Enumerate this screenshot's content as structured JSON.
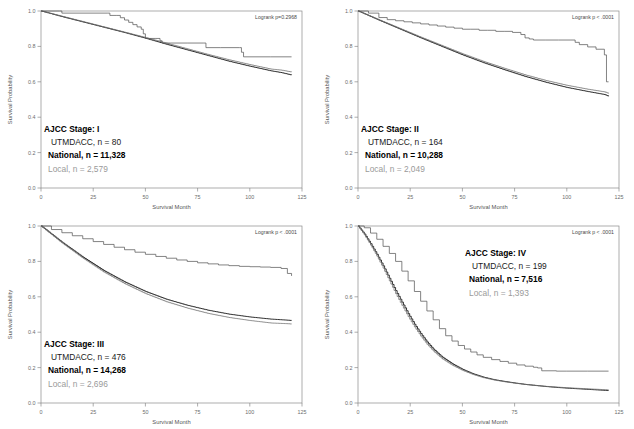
{
  "figure": {
    "axis": {
      "xlabel": "Survival Month",
      "ylabel": "Survival Probability",
      "xticks": [
        "0",
        "25",
        "50",
        "75",
        "100",
        "125"
      ],
      "yticks": [
        "1.0",
        "0.8",
        "0.6",
        "0.4",
        "0.2",
        "0.0"
      ],
      "xlim": [
        0,
        125
      ],
      "ylim": [
        0.0,
        1.0
      ]
    },
    "series_names": {
      "utmdacc": "UTMDACC",
      "national": "National",
      "local": "Local"
    },
    "colors": {
      "utmdacc": "#5a5a5a",
      "national": "#1c1c1c",
      "local": "#9a9a9a",
      "frame": "#8a8a8a",
      "background": "#ffffff"
    }
  },
  "chart_data": [
    {
      "type": "line",
      "title": "AJCC Stage: I",
      "panel_index": 0,
      "stage_label": "AJCC Stage: I",
      "utmdacc_label": "UTMDACC,  n = 80",
      "national_label": "National, n = 11,328",
      "local_label": "Local, n =  2,579",
      "pvalue_label": "Logrank p=0.2968",
      "counts": {
        "utmdacc": 80,
        "national": 11328,
        "local": 2579
      },
      "xlabel": "Survival Month",
      "ylabel": "Survival Probability",
      "xlim": [
        0,
        125
      ],
      "ylim": [
        0.0,
        1.0
      ],
      "grid": false,
      "legend_position": "inside-lower-left",
      "series": [
        {
          "name": "UTMDACC",
          "x": [
            0,
            2,
            9,
            10,
            32,
            33,
            36,
            38,
            40,
            42,
            44,
            46,
            48,
            49,
            50,
            51,
            55,
            57,
            58,
            62,
            70,
            78,
            79,
            86,
            95,
            96,
            97,
            110,
            120
          ],
          "values": [
            1.0,
            1.0,
            1.0,
            0.988,
            0.988,
            0.975,
            0.975,
            0.962,
            0.949,
            0.936,
            0.923,
            0.91,
            0.897,
            0.871,
            0.845,
            0.845,
            0.845,
            0.832,
            0.819,
            0.819,
            0.819,
            0.819,
            0.793,
            0.793,
            0.793,
            0.767,
            0.741,
            0.741,
            0.741
          ]
        },
        {
          "name": "National",
          "x": [
            0,
            10,
            20,
            30,
            40,
            50,
            60,
            70,
            80,
            90,
            100,
            110,
            115,
            120
          ],
          "values": [
            1.0,
            0.968,
            0.938,
            0.908,
            0.878,
            0.846,
            0.812,
            0.78,
            0.748,
            0.716,
            0.688,
            0.662,
            0.652,
            0.638
          ]
        },
        {
          "name": "Local",
          "x": [
            0,
            10,
            20,
            30,
            40,
            50,
            60,
            70,
            80,
            90,
            100,
            110,
            115,
            120
          ],
          "values": [
            1.0,
            0.97,
            0.94,
            0.91,
            0.88,
            0.85,
            0.818,
            0.786,
            0.754,
            0.724,
            0.697,
            0.672,
            0.666,
            0.655
          ]
        }
      ]
    },
    {
      "type": "line",
      "title": "AJCC Stage: II",
      "panel_index": 1,
      "stage_label": "AJCC Stage: II",
      "utmdacc_label": "UTMDACC,  n = 164",
      "national_label": "National, n = 10,288",
      "local_label": "Local, n = 2,049",
      "pvalue_label": "Logrank p < .0001",
      "counts": {
        "utmdacc": 164,
        "national": 10288,
        "local": 2049
      },
      "xlabel": "Survival Month",
      "ylabel": "Survival Probability",
      "xlim": [
        0,
        125
      ],
      "ylim": [
        0.0,
        1.0
      ],
      "grid": false,
      "legend_position": "inside-lower-left",
      "series": [
        {
          "name": "UTMDACC",
          "x": [
            0,
            5,
            10,
            14,
            18,
            22,
            26,
            30,
            34,
            38,
            42,
            46,
            50,
            54,
            58,
            62,
            66,
            70,
            74,
            78,
            80,
            82,
            84,
            90,
            96,
            102,
            104,
            106,
            110,
            114,
            118,
            119,
            120
          ],
          "values": [
            1.0,
            0.988,
            0.963,
            0.951,
            0.945,
            0.939,
            0.933,
            0.927,
            0.921,
            0.915,
            0.909,
            0.903,
            0.897,
            0.897,
            0.891,
            0.891,
            0.885,
            0.885,
            0.879,
            0.867,
            0.848,
            0.842,
            0.836,
            0.836,
            0.836,
            0.836,
            0.823,
            0.81,
            0.797,
            0.784,
            0.752,
            0.6,
            0.6
          ]
        },
        {
          "name": "National",
          "x": [
            0,
            10,
            20,
            30,
            40,
            50,
            60,
            70,
            80,
            90,
            100,
            110,
            118,
            120
          ],
          "values": [
            1.0,
            0.948,
            0.898,
            0.848,
            0.8,
            0.752,
            0.708,
            0.668,
            0.63,
            0.597,
            0.568,
            0.545,
            0.528,
            0.518
          ]
        },
        {
          "name": "Local",
          "x": [
            0,
            10,
            20,
            30,
            40,
            50,
            60,
            70,
            80,
            90,
            100,
            110,
            118,
            120
          ],
          "values": [
            1.0,
            0.95,
            0.901,
            0.852,
            0.805,
            0.758,
            0.715,
            0.676,
            0.639,
            0.607,
            0.58,
            0.558,
            0.543,
            0.534
          ]
        }
      ]
    },
    {
      "type": "line",
      "title": "AJCC Stage: III",
      "panel_index": 2,
      "stage_label": "AJCC Stage: III",
      "utmdacc_label": "UTMDACC,  n = 476",
      "national_label": "National, n = 14,268",
      "local_label": "Local, n =  2,696",
      "pvalue_label": "Logrank p < .0001",
      "counts": {
        "utmdacc": 476,
        "national": 14268,
        "local": 2696
      },
      "xlabel": "Survival Month",
      "ylabel": "Survival Probability",
      "xlim": [
        0,
        125
      ],
      "ylim": [
        0.0,
        1.0
      ],
      "grid": false,
      "legend_position": "inside-lower-left",
      "series": [
        {
          "name": "UTMDACC",
          "x": [
            0,
            5,
            10,
            15,
            20,
            25,
            30,
            35,
            40,
            45,
            50,
            55,
            60,
            65,
            70,
            75,
            80,
            85,
            90,
            95,
            100,
            105,
            110,
            115,
            118,
            120
          ],
          "values": [
            1.0,
            0.98,
            0.962,
            0.945,
            0.928,
            0.912,
            0.896,
            0.88,
            0.866,
            0.852,
            0.84,
            0.828,
            0.818,
            0.808,
            0.8,
            0.792,
            0.786,
            0.78,
            0.776,
            0.772,
            0.77,
            0.768,
            0.766,
            0.76,
            0.732,
            0.718
          ]
        },
        {
          "name": "National",
          "x": [
            0,
            10,
            20,
            30,
            40,
            50,
            60,
            70,
            80,
            90,
            100,
            110,
            118,
            120
          ],
          "values": [
            1.0,
            0.908,
            0.824,
            0.748,
            0.684,
            0.63,
            0.586,
            0.552,
            0.524,
            0.502,
            0.486,
            0.474,
            0.468,
            0.466
          ]
        },
        {
          "name": "Local",
          "x": [
            0,
            10,
            20,
            30,
            40,
            50,
            60,
            70,
            80,
            90,
            100,
            110,
            118,
            120
          ],
          "values": [
            1.0,
            0.904,
            0.818,
            0.74,
            0.674,
            0.618,
            0.572,
            0.536,
            0.506,
            0.483,
            0.466,
            0.452,
            0.448,
            0.446
          ]
        }
      ]
    },
    {
      "type": "line",
      "title": "AJCC Stage: IV",
      "panel_index": 3,
      "stage_label": "AJCC Stage: IV",
      "utmdacc_label": "UTMDACC,  n =  199",
      "national_label": "National, n = 7,516",
      "local_label": "Local, n =  1,393",
      "pvalue_label": "Logrank p < .0001",
      "counts": {
        "utmdacc": 199,
        "national": 7516,
        "local": 1393
      },
      "xlabel": "Survival Month",
      "ylabel": "Survival Probability",
      "xlim": [
        0,
        125
      ],
      "ylim": [
        0.0,
        1.0
      ],
      "grid": false,
      "legend_position": "inside-upper-right",
      "series": [
        {
          "name": "UTMDACC",
          "x": [
            0,
            3,
            6,
            9,
            12,
            15,
            18,
            21,
            24,
            27,
            30,
            33,
            36,
            39,
            42,
            45,
            48,
            51,
            54,
            57,
            60,
            64,
            68,
            72,
            76,
            80,
            84,
            86,
            88,
            95,
            100,
            110,
            120
          ],
          "values": [
            1.0,
            0.99,
            0.96,
            0.925,
            0.885,
            0.845,
            0.8,
            0.745,
            0.69,
            0.63,
            0.575,
            0.52,
            0.47,
            0.42,
            0.38,
            0.35,
            0.325,
            0.305,
            0.288,
            0.272,
            0.258,
            0.245,
            0.235,
            0.225,
            0.215,
            0.208,
            0.202,
            0.198,
            0.182,
            0.18,
            0.18,
            0.18,
            0.18
          ]
        },
        {
          "name": "National",
          "x": [
            0,
            3,
            6,
            9,
            12,
            15,
            18,
            21,
            24,
            27,
            30,
            33,
            36,
            40,
            45,
            50,
            55,
            60,
            65,
            70,
            75,
            80,
            85,
            90,
            95,
            100,
            110,
            120
          ],
          "values": [
            1.0,
            0.955,
            0.9,
            0.84,
            0.775,
            0.705,
            0.635,
            0.57,
            0.505,
            0.445,
            0.392,
            0.345,
            0.305,
            0.262,
            0.222,
            0.19,
            0.165,
            0.146,
            0.132,
            0.122,
            0.113,
            0.105,
            0.099,
            0.093,
            0.088,
            0.084,
            0.077,
            0.07
          ]
        },
        {
          "name": "Local",
          "x": [
            0,
            3,
            6,
            9,
            12,
            15,
            18,
            21,
            24,
            27,
            30,
            33,
            36,
            40,
            45,
            50,
            55,
            60,
            65,
            70,
            75,
            80,
            85,
            90,
            95,
            100,
            110,
            120
          ],
          "values": [
            1.0,
            0.95,
            0.892,
            0.83,
            0.762,
            0.69,
            0.618,
            0.552,
            0.488,
            0.43,
            0.378,
            0.332,
            0.294,
            0.252,
            0.214,
            0.184,
            0.161,
            0.143,
            0.13,
            0.12,
            0.112,
            0.105,
            0.099,
            0.094,
            0.09,
            0.086,
            0.08,
            0.074
          ]
        }
      ]
    }
  ]
}
